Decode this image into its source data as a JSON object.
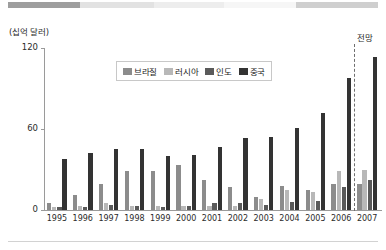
{
  "header_band": {
    "segments": [
      {
        "left": 8,
        "width": 72,
        "color": "#9e9e9e"
      },
      {
        "left": 80,
        "width": 74,
        "color": "#e2e2e2"
      },
      {
        "left": 154,
        "width": 70,
        "color": "#ededed"
      },
      {
        "left": 224,
        "width": 72,
        "color": "#f6f6f6"
      },
      {
        "left": 296,
        "width": 82,
        "color": "#cfcfcf"
      }
    ]
  },
  "axis": {
    "unit_label": "(십억 달러)",
    "y_ticks": [
      "120",
      "60",
      "0"
    ],
    "y_values": [
      120,
      60,
      0
    ],
    "y_max": 120,
    "forecast_label": "전망"
  },
  "legend": {
    "items": [
      {
        "label": "브라질",
        "color": "#8c8c8c"
      },
      {
        "label": "러시아",
        "color": "#b8b8b8"
      },
      {
        "label": "인도",
        "color": "#5a5a5a"
      },
      {
        "label": "중국",
        "color": "#333333"
      }
    ]
  },
  "chart_data": {
    "type": "bar",
    "title": "",
    "subtitle": "",
    "xlabel": "",
    "ylabel": "(십억 달러)",
    "ylim": [
      0,
      120
    ],
    "yticks": [
      0,
      60,
      120
    ],
    "grid": false,
    "legend_position": "top-center",
    "annotations": [
      {
        "text": "전망",
        "x": "2007",
        "note": "forecast region right of dashed divider"
      }
    ],
    "categories": [
      "1995",
      "1996",
      "1997",
      "1998",
      "1999",
      "2000",
      "2001",
      "2002",
      "2003",
      "2004",
      "2005",
      "2006",
      "2007"
    ],
    "series": [
      {
        "name": "브라질",
        "color": "#8c8c8c",
        "values": [
          5,
          11,
          19,
          29,
          29,
          33,
          22,
          17,
          10,
          18,
          15,
          19,
          19
        ]
      },
      {
        "name": "러시아",
        "color": "#b8b8b8",
        "values": [
          2,
          3,
          5,
          3,
          3,
          3,
          3,
          3,
          8,
          15,
          13,
          29,
          30
        ]
      },
      {
        "name": "인도",
        "color": "#5a5a5a",
        "values": [
          2,
          2,
          4,
          3,
          2,
          3,
          5,
          5,
          4,
          6,
          7,
          17,
          22
        ]
      },
      {
        "name": "중국",
        "color": "#333333",
        "values": [
          38,
          42,
          45,
          45,
          40,
          41,
          47,
          53,
          54,
          61,
          72,
          98,
          113
        ]
      }
    ]
  }
}
